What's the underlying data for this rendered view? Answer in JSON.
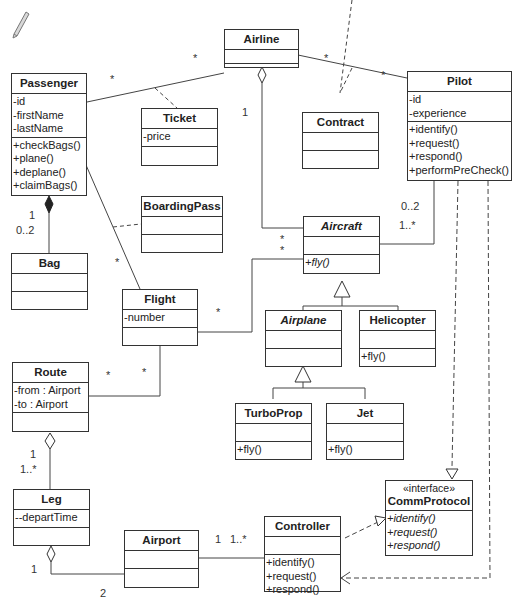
{
  "diagram": {
    "type": "UML class diagram",
    "classes": {
      "airline": {
        "name": "Airline",
        "attributes": [],
        "operations": []
      },
      "passenger": {
        "name": "Passenger",
        "attributes": [
          "-id",
          "-firstName",
          "-lastName"
        ],
        "operations": [
          "+checkBags()",
          "+plane()",
          "+deplane()",
          "+claimBags()"
        ]
      },
      "ticket": {
        "name": "Ticket",
        "attributes": [
          "-price"
        ],
        "operations": []
      },
      "contract": {
        "name": "Contract",
        "attributes": [],
        "operations": []
      },
      "pilot": {
        "name": "Pilot",
        "attributes": [
          "-id",
          "-experience"
        ],
        "operations": [
          "+identify()",
          "+request()",
          "+respond()",
          "+performPreCheck()"
        ]
      },
      "boarding_pass": {
        "name": "BoardingPass",
        "attributes": [],
        "operations": []
      },
      "aircraft": {
        "name": "Aircraft",
        "abstract": true,
        "attributes": [],
        "operations": [
          "+fly()"
        ]
      },
      "bag": {
        "name": "Bag",
        "attributes": [],
        "operations": []
      },
      "flight": {
        "name": "Flight",
        "attributes": [
          "-number"
        ],
        "operations": []
      },
      "airplane": {
        "name": "Airplane",
        "abstract": true,
        "attributes": [],
        "operations": []
      },
      "helicopter": {
        "name": "Helicopter",
        "attributes": [],
        "operations": [
          "+fly()"
        ]
      },
      "route": {
        "name": "Route",
        "attributes": [
          "-from : Airport",
          "-to : Airport"
        ],
        "operations": []
      },
      "turboprop": {
        "name": "TurboProp",
        "attributes": [],
        "operations": [
          "+fly()"
        ]
      },
      "jet": {
        "name": "Jet",
        "attributes": [],
        "operations": [
          "+fly()"
        ]
      },
      "leg": {
        "name": "Leg",
        "attributes": [
          "--departTime"
        ],
        "operations": []
      },
      "comm_protocol": {
        "stereotype": "«interface»",
        "name": "CommProtocol",
        "attributes": [],
        "operations": [
          "+identify()",
          "+request()",
          "+respond()"
        ]
      },
      "airport": {
        "name": "Airport",
        "attributes": [],
        "operations": []
      },
      "controller": {
        "name": "Controller",
        "attributes": [],
        "operations": [
          "+identify()",
          "+request()",
          "+respond()"
        ]
      }
    },
    "multiplicities": {
      "passenger_airline_p": "*",
      "passenger_airline_a": "*",
      "airline_pilot_a": "*",
      "airline_pilot_p": "*",
      "airline_aircraft": "1",
      "passenger_bag_1": "1",
      "passenger_bag_2": "0..2",
      "passenger_flight": "*",
      "aircraft_dot1": "*",
      "aircraft_dot2": "*",
      "pilot_aircraft_1": "0..2",
      "pilot_aircraft_2": "1..*",
      "flight_aircraft": "*",
      "route_flight_1": "*",
      "route_flight_2": "*",
      "route_leg_1": "1",
      "route_leg_2": "1..*",
      "leg_airport_1": "1",
      "leg_airport_2": "2",
      "airport_controller_1": "1",
      "airport_controller_2": "1..*"
    }
  }
}
